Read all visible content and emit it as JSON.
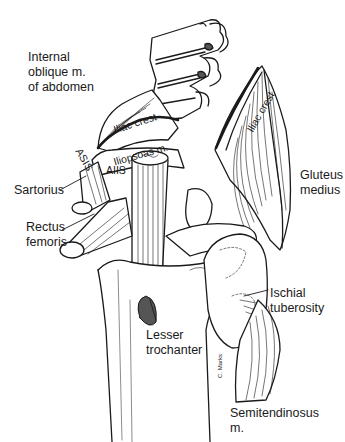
{
  "figure": {
    "type": "anatomical-illustration",
    "signature": "C. Marks"
  },
  "labels": {
    "internal_oblique": "Internal\noblique m.\nof abdomen",
    "iliac_crest_left": "Iliac crest",
    "iliac_crest_right": "Iliac crest",
    "asis": "ASIS",
    "aiis": "AIIS",
    "iliopsoas": "Iliopsoas m.",
    "sartorius": "Sartorius",
    "rectus_femoris": "Rectus\nfemoris",
    "gluteus_medius": "Gluteus\nmedius",
    "ischial_tuberosity": "Ischial\ntuberosity",
    "lesser_trochanter": "Lesser\ntrochanter",
    "semitendinosus": "Semitendinosus\nm."
  },
  "colors": {
    "ink": "#1a1a1a",
    "background": "#ffffff",
    "shade": "#555555"
  }
}
